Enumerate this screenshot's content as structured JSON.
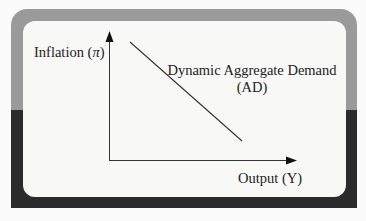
{
  "diagram": {
    "type": "economics-curve",
    "y_axis": {
      "label_prefix": "Inflation (",
      "label_symbol": "π",
      "label_suffix": ")"
    },
    "x_axis": {
      "label": "Output (Y)"
    },
    "curve": {
      "name_line1": "Dynamic Aggregate Demand",
      "name_line2": "(AD)",
      "slope": "downward"
    },
    "colors": {
      "frame_top": "#9a9a9a",
      "frame_bottom": "#2b2b2b",
      "panel": "#f8f8f6",
      "ink": "#222222"
    }
  }
}
